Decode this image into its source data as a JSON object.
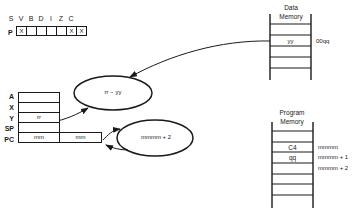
{
  "status_register": {
    "label": "P",
    "flags": [
      "S",
      "V",
      "B",
      "D",
      "I",
      "Z",
      "C"
    ],
    "values": [
      "X",
      "",
      "",
      "",
      "",
      "X",
      "X"
    ]
  },
  "registers": {
    "labels": [
      "A",
      "X",
      "Y",
      "SP",
      "PC"
    ],
    "A": "",
    "X": "",
    "Y": "rr",
    "SP": "",
    "PC_high": "mm",
    "PC_low": "mm"
  },
  "operations": {
    "subtract": "rr − yy",
    "pc_increment": "mmmm + 2"
  },
  "data_memory": {
    "title_line1": "Data",
    "title_line2": "Memory",
    "cell_value": "yy",
    "cell_address": "00qq"
  },
  "program_memory": {
    "title_line1": "Program",
    "title_line2": "Memory",
    "cells": [
      {
        "value": "C4",
        "address": "mmmm"
      },
      {
        "value": "qq",
        "address": "mmmm + 1"
      },
      {
        "value": "",
        "address": "mmmm + 2"
      }
    ]
  }
}
